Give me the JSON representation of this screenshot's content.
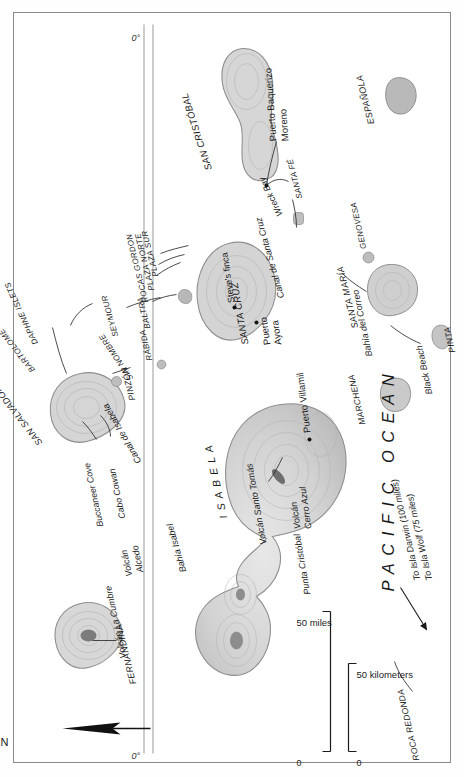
{
  "map": {
    "title": "Galápagos Islands",
    "ocean_label": "PACIFIC OCEAN",
    "equator_label_top": "0°",
    "equator_label_bottom": "0°",
    "north_label": "N",
    "note_darwin": "To Isla Darwin (100 miles)",
    "note_wolf": "To Isla Wolf (75 miles)"
  },
  "scale": {
    "miles_zero": "0",
    "miles_label": "50 miles",
    "km_zero": "0",
    "km_label": "50 kilometers"
  },
  "islands": [
    {
      "name": "MARCHENA"
    },
    {
      "name": "GENOVESA"
    },
    {
      "name": "PINTA"
    },
    {
      "name": "ROCA REDONDA"
    },
    {
      "name": "SAN SALVADOR"
    },
    {
      "name": "BARTOLOMÉ"
    },
    {
      "name": "DAPHNE ISLETS"
    },
    {
      "name": "SEYMOUR"
    },
    {
      "name": "BALTRA"
    },
    {
      "name": "ROCAS GORDON"
    },
    {
      "name": "PLAZA NORTE"
    },
    {
      "name": "PLAZA SUR"
    },
    {
      "name": "SANTA CRUZ"
    },
    {
      "name": "SANTA FÉ"
    },
    {
      "name": "SAN CRISTÓBAL"
    },
    {
      "name": "ESPAÑOLA"
    },
    {
      "name": "SANTA MARÍA"
    },
    {
      "name": "RÁBIDA"
    },
    {
      "name": "PINZÓN"
    },
    {
      "name": "SIN NOMBRE"
    },
    {
      "name": "ISABELA"
    },
    {
      "name": "FERNANDINA"
    }
  ],
  "places": [
    {
      "name": "Buccaneer Cove"
    },
    {
      "name": "Cabo Cowan"
    },
    {
      "name": "Canal de Isabela"
    },
    {
      "name": "Canal de Santa Cruz"
    },
    {
      "name": "Steve's finca"
    },
    {
      "name": "Puerto Ayora"
    },
    {
      "name": "Wreck Bay"
    },
    {
      "name": "Puerto Baquerizo Moreno"
    },
    {
      "name": "Bahía del Correo"
    },
    {
      "name": "Black Beach"
    },
    {
      "name": "Puerto Villamil"
    },
    {
      "name": "Bahía Isabel"
    },
    {
      "name": "Punta Cristóbal"
    },
    {
      "name": "Volcán La Cumbre"
    },
    {
      "name": "Volcán Alcedo"
    },
    {
      "name": "Volcán Santo Tomás"
    },
    {
      "name": "Volcán Cerro Azul"
    }
  ],
  "labels": {
    "pacific_ocean": "PACIFIC OCEAN",
    "marchena": "MARCHENA",
    "genovesa": "GENOVESA",
    "pinta": "PINTA",
    "roca_redonda": "ROCA REDONDA",
    "san_salvador": "SAN SALVADOR",
    "bartolome": "BARTOLOMÉ",
    "daphne_islets": "DAPHNE ISLETS",
    "seymour": "SEYMOUR",
    "baltra": "BALTRA",
    "rocas_gordon": "ROCAS GORDON",
    "plaza_norte": "PLAZA NORTE",
    "plaza_sur": "PLAZA SUR",
    "santa_cruz": "SANTA CRUZ",
    "santa_fe": "SANTA FÉ",
    "san_cristobal": "SAN CRISTÓBAL",
    "espanola": "ESPAÑOLA",
    "santa_maria": "SANTA MARÍA",
    "rabida": "RÁBIDA",
    "pinzon": "PINZÓN",
    "sin_nombre": "SIN NOMBRE",
    "isabela": "I S A B E L A",
    "fernandina": "FERNANDINA",
    "buccaneer_cove": "Buccaneer Cove",
    "cabo_cowan": "Cabo Cowan",
    "canal_de_isabela": "Canal de Isabela",
    "canal_de_santa_cruz": "Canal de Santa Cruz",
    "steves_finca": "Steve's finca",
    "puerto_ayora_1": "Puerto",
    "puerto_ayora_2": "Ayora",
    "wreck_bay": "Wreck Bay",
    "puerto_baquerizo_1": "Puerto Baquerizo",
    "puerto_baquerizo_2": "Moreno",
    "bahia_del_correo": "Bahía del Correo",
    "black_beach": "Black Beach",
    "puerto_villamil": "Puerto Villamil",
    "bahia_isabel": "Bahía Isabel",
    "punta_cristobal": "Punta Cristóbal",
    "volcan_la_cumbre": "Volcán La Cumbre",
    "volcan_alcedo_1": "Volcán",
    "volcan_alcedo_2": "Alcedo",
    "volcan_santo_tomas": "Volcán Santo Tomás",
    "volcan_cerro_azul_1": "Volcán",
    "volcan_cerro_azul_2": "Cerro Azul",
    "to_isla_darwin": "To Isla Darwin (100 miles)",
    "to_isla_wolf": "To Isla Wolf (75 miles)",
    "north": "N",
    "equator_top": "0°",
    "equator_bottom": "0°",
    "scale_miles_0": "0",
    "scale_miles_50": "50 miles",
    "scale_km_0": "0",
    "scale_km_50": "50 kilometers"
  },
  "colors": {
    "land_fill": "#cfcfcf",
    "land_stroke": "#8c8c8c",
    "frame": "#8a8a8a",
    "text": "#1b1b1b",
    "equator": "#9a9a9a",
    "background": "#ffffff"
  }
}
